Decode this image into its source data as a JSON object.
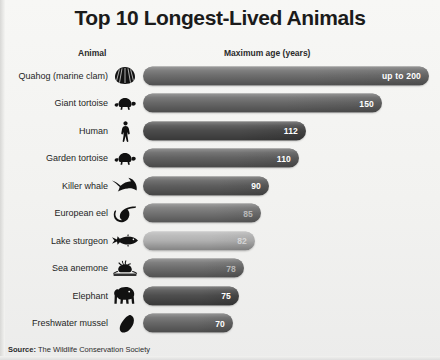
{
  "title": "Top 10 Longest-Lived Animals",
  "headers": {
    "animal": "Animal",
    "max_age": "Maximum age (years)"
  },
  "source": {
    "prefix": "Source:",
    "text": " The Wildlife Conservation Society"
  },
  "chart_data": {
    "type": "bar",
    "title": "Top 10 Longest-Lived Animals",
    "xlabel": "Maximum age (years)",
    "ylabel": "Animal",
    "orientation": "horizontal",
    "grid": false,
    "legend": false,
    "xlim": [
      0,
      200
    ],
    "categories": [
      "Quahog (marine clam)",
      "Giant tortoise",
      "Human",
      "Garden tortoise",
      "Killer whale",
      "European eel",
      "Lake sturgeon",
      "Sea anemone",
      "Elephant",
      "Freshwater mussel"
    ],
    "values": [
      200,
      150,
      112,
      110,
      90,
      85,
      82,
      78,
      75,
      70
    ],
    "value_labels": [
      "up to 200",
      "150",
      "112",
      "110",
      "90",
      "85",
      "82",
      "78",
      "75",
      "70"
    ]
  },
  "rows": [
    {
      "label": "Quahog (marine clam)",
      "value_label": "up to 200",
      "value": 200,
      "width": 286,
      "color": "#6f6f6f",
      "icon": "clam-icon",
      "faint": false
    },
    {
      "label": "Giant tortoise",
      "value_label": "150",
      "value": 150,
      "width": 239,
      "color": "#6a6a6a",
      "icon": "tortoise-icon",
      "faint": false
    },
    {
      "label": "Human",
      "value_label": "112",
      "value": 112,
      "width": 163,
      "color": "#4d4d4d",
      "icon": "human-icon",
      "faint": false
    },
    {
      "label": "Garden tortoise",
      "value_label": "110",
      "value": 110,
      "width": 156,
      "color": "#646464",
      "icon": "tortoise-icon",
      "faint": false
    },
    {
      "label": "Killer whale",
      "value_label": "90",
      "value": 90,
      "width": 126,
      "color": "#606060",
      "icon": "orca-icon",
      "faint": false
    },
    {
      "label": "European eel",
      "value_label": "85",
      "value": 85,
      "width": 118,
      "color": "#767676",
      "icon": "eel-icon",
      "faint": true
    },
    {
      "label": "Lake sturgeon",
      "value_label": "82",
      "value": 82,
      "width": 112,
      "color": "#b4b4b4",
      "icon": "sturgeon-icon",
      "faint": true
    },
    {
      "label": "Sea anemone",
      "value_label": "78",
      "value": 78,
      "width": 101,
      "color": "#707070",
      "icon": "anemone-icon",
      "faint": true
    },
    {
      "label": "Elephant",
      "value_label": "75",
      "value": 75,
      "width": 96,
      "color": "#4f4f4f",
      "icon": "elephant-icon",
      "faint": false
    },
    {
      "label": "Freshwater mussel",
      "value_label": "70",
      "value": 70,
      "width": 90,
      "color": "#6a6a6a",
      "icon": "mussel-icon",
      "faint": false
    }
  ]
}
